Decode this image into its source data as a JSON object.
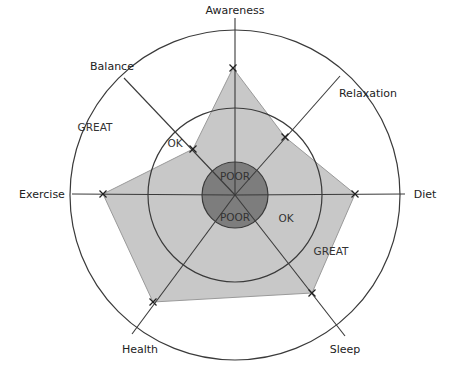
{
  "diagram": {
    "type": "radar-wheel",
    "center": [
      235,
      195
    ],
    "rings": [
      {
        "name": "POOR",
        "radius": 33,
        "fill": "#7d7d7d"
      },
      {
        "name": "OK",
        "radius": 87
      },
      {
        "name": "GREAT",
        "radius": 165
      }
    ],
    "axes": [
      {
        "label": "Awareness",
        "label_pos": [
          235,
          14
        ],
        "end": [
          235,
          18
        ],
        "marker": [
          233,
          68
        ]
      },
      {
        "label": "Relaxation",
        "label_pos": [
          368,
          97
        ],
        "end": [
          340,
          76
        ],
        "marker": [
          285,
          137
        ]
      },
      {
        "label": "Diet",
        "label_pos": [
          425,
          198
        ],
        "end": [
          405,
          194
        ],
        "marker": [
          355,
          194
        ]
      },
      {
        "label": "Sleep",
        "label_pos": [
          345,
          353
        ],
        "end": [
          345,
          336
        ],
        "marker": [
          312,
          293
        ]
      },
      {
        "label": "Health",
        "label_pos": [
          140,
          353
        ],
        "end": [
          132,
          334
        ],
        "marker": [
          153,
          302
        ]
      },
      {
        "label": "Exercise",
        "label_pos": [
          42,
          198
        ],
        "end": [
          72,
          194
        ],
        "marker": [
          103,
          194
        ]
      },
      {
        "label": "Balance",
        "label_pos": [
          112,
          70
        ],
        "end": [
          124,
          78
        ],
        "marker": [
          193,
          149
        ]
      }
    ],
    "zone_labels": [
      {
        "text": "POOR",
        "pos": [
          235,
          180
        ]
      },
      {
        "text": "POOR",
        "pos": [
          235,
          221
        ]
      },
      {
        "text": "OK",
        "pos": [
          175,
          147
        ]
      },
      {
        "text": "OK",
        "pos": [
          286,
          222
        ]
      },
      {
        "text": "GREAT",
        "pos": [
          95,
          131
        ]
      },
      {
        "text": "GREAT",
        "pos": [
          331,
          255
        ]
      }
    ],
    "colors": {
      "polygon_fill": "#c8c8c8",
      "polygon_stroke": "#9a9a9a",
      "line": "#3a3a3a",
      "poor_fill": "#7d7d7d"
    }
  }
}
